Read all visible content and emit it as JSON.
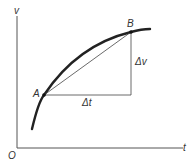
{
  "diagram": {
    "axes": {
      "y_label": "v",
      "x_label": "t",
      "origin_label": "O"
    },
    "points": {
      "a_label": "A",
      "b_label": "B"
    },
    "deltas": {
      "dt_label": "Δt",
      "dv_label": "Δv"
    },
    "colors": {
      "curve": "#222222",
      "lines": "#444444",
      "axes": "#555555"
    }
  }
}
